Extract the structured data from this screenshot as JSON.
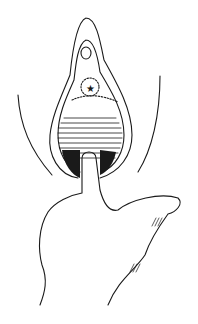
{
  "figure": {
    "type": "line-art medical illustration",
    "colors": {
      "ink": "#1a1a1a",
      "background": "#ffffff"
    },
    "labels": {
      "marker": "star"
    },
    "caption": ""
  }
}
